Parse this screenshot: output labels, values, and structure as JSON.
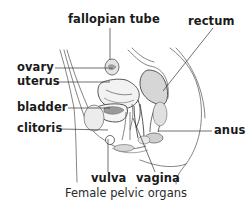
{
  "figure": {
    "caption": "Female pelvic organs",
    "labels": {
      "fallopian_tube": "fallopian tube",
      "rectum": "rectum",
      "ovary": "ovary",
      "uterus": "uterus",
      "bladder": "bladder",
      "clitoris": "clitoris",
      "anus": "anus",
      "vulva": "vulva",
      "vagina": "vagina"
    }
  },
  "colors": {
    "line": "#555555",
    "leader": "#333333",
    "fill_shade": "#c8c8c8",
    "text": "#1a1a1a"
  }
}
